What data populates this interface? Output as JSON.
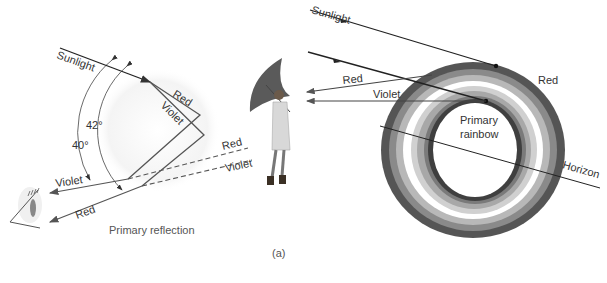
{
  "figure": {
    "caption": "(a)",
    "left_panel": {
      "title": "Primary reflection",
      "labels": {
        "sunlight": "Sunlight",
        "red_in": "Red",
        "violet_in": "Violet",
        "angle_42": "42°",
        "angle_40": "40°",
        "red_dashed": "Red",
        "violet_dashed": "Violet",
        "violet_out": "Violet",
        "red_out": "Red"
      }
    },
    "right_panel": {
      "labels": {
        "sunlight": "Sunlight",
        "red_ray": "Red",
        "violet_ray": "Violet",
        "red_band": "Red",
        "center_line1": "Primary",
        "center_line2": "rainbow",
        "horizon": "Horizon"
      },
      "ring_colors": [
        "#555555",
        "#888888",
        "#b4b4b4",
        "#ffffff",
        "#cfcfcf",
        "#a8a8a8",
        "#7d7d7d",
        "#3f3f3f"
      ]
    }
  }
}
